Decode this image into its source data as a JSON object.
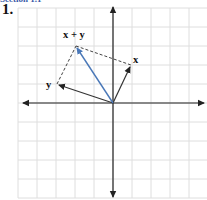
{
  "header": {
    "cropped_heading": "Section 1.1",
    "problem_number": "1."
  },
  "diagram": {
    "type": "vector-addition",
    "grid": {
      "origin_px": [
        113,
        103
      ],
      "unit_px": 19,
      "x_range": [
        -5,
        5
      ],
      "y_range": [
        -5,
        5
      ]
    },
    "vectors": [
      {
        "name": "x",
        "label": "x",
        "components": [
          1,
          2
        ],
        "color": "#333333",
        "style": "solid"
      },
      {
        "name": "y",
        "label": "y",
        "components": [
          -3,
          1
        ],
        "color": "#333333",
        "style": "solid"
      },
      {
        "name": "x+y",
        "label": "x + y",
        "components": [
          -2,
          3
        ],
        "color": "#4a78b8",
        "style": "solid"
      }
    ],
    "parallelogram_edges": "dashed",
    "colors": {
      "grid": "#dddddd",
      "axis": "#222222",
      "sum_vector": "#4a78b8"
    }
  }
}
